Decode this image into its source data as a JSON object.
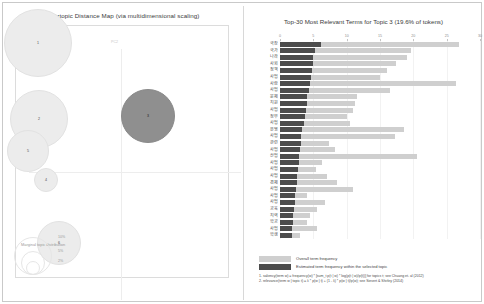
{
  "left_panel": {
    "title": "Intertopic Distance Map (via multidimensional scaling)",
    "axis_x_label": "PC1",
    "axis_y_label": "PC2",
    "marginal_legend_title": "Marginal topic distribution",
    "marginal_ticks": [
      "2%",
      "5%",
      "10%"
    ],
    "topics": [
      {
        "id": "1",
        "x": 35,
        "y": 40,
        "r": 34,
        "selected": false
      },
      {
        "id": "2",
        "x": 36,
        "y": 116,
        "r": 29,
        "selected": false
      },
      {
        "id": "5",
        "x": 25,
        "y": 148,
        "r": 21,
        "selected": false
      },
      {
        "id": "4",
        "x": 43,
        "y": 177,
        "r": 12,
        "selected": false
      },
      {
        "id": "6",
        "x": 56,
        "y": 240,
        "r": 22,
        "selected": false
      },
      {
        "id": "3",
        "x": 145,
        "y": 113,
        "r": 27,
        "selected": true
      }
    ],
    "colors": {
      "bubble": "#ececec",
      "selected_bubble": "#8f8f8f"
    }
  },
  "right_panel": {
    "title": "Top-30 Most Relevant Terms for Topic 3 (19.6% of tokens)",
    "legend": {
      "overall_label": "Overall term frequency",
      "topic_label": "Estimated term frequency within the selected topic",
      "overall_color": "#cfcfcf",
      "topic_color": "#4c4c4c"
    },
    "notes": [
      "1. saliency(term w) = frequency(w) * [sum_t p(t | w) * log(p(t | w)/p(t))] for topics t; see Chuang et. al (2012)",
      "2. relevance(term w | topic t) = λ * p(w | t) + (1 - λ) * p(w | t)/p(w); see Sievert & Shirley (2014)"
    ]
  },
  "chart_data": {
    "type": "bar",
    "orientation": "horizontal",
    "title": "Top-30 Most Relevant Terms for Topic 3 (19.6% of tokens)",
    "xlabel": "",
    "ylabel": "",
    "xlim": [
      0,
      30
    ],
    "xticks": [
      0,
      5,
      10,
      15,
      20,
      25,
      30
    ],
    "grid": true,
    "legend_position": "bottom",
    "categories": [
      "국장",
      "국가",
      "나라",
      "사회",
      "정책",
      "사업",
      "사람",
      "사업",
      "문제",
      "지원",
      "사업",
      "정부",
      "사업",
      "운영",
      "사업",
      "관련",
      "사업",
      "산업",
      "사업",
      "사업",
      "사업",
      "경제",
      "사업",
      "사업",
      "사업",
      "교육",
      "지역",
      "학교",
      "사업",
      "학생"
    ],
    "series": [
      {
        "name": "Overall term frequency",
        "values": [
          26.8,
          19.6,
          19.0,
          17.4,
          16.0,
          15.0,
          26.4,
          16.5,
          11.6,
          11.3,
          11.0,
          10.0,
          10.5,
          18.6,
          17.2,
          7.4,
          8.3,
          20.6,
          6.3,
          5.4,
          7.0,
          8.5,
          11.0,
          4.0,
          6.7,
          5.5,
          4.5,
          4.0,
          5.5,
          3.0
        ]
      },
      {
        "name": "Estimated term frequency within the selected topic",
        "values": [
          6.1,
          5.2,
          5.0,
          4.9,
          4.8,
          4.6,
          4.5,
          4.3,
          4.1,
          4.0,
          3.9,
          3.8,
          3.6,
          3.3,
          3.2,
          3.1,
          3.0,
          2.9,
          2.8,
          2.7,
          2.6,
          2.5,
          2.4,
          2.3,
          2.2,
          2.1,
          2.0,
          1.9,
          1.85,
          1.8
        ]
      }
    ]
  }
}
